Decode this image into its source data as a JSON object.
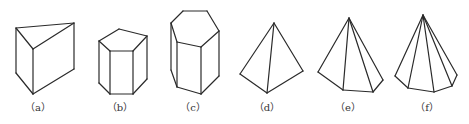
{
  "figure": {
    "title": "",
    "colors": {
      "background": "#ffffff",
      "stroke": "#2a2a2a",
      "label": "#333333"
    },
    "shapes": [
      {
        "id": "a",
        "name": "triangular-prism",
        "label": "（a）",
        "label_pos": [
          38,
          111
        ],
        "edges": [
          [
            [
              16,
              28
            ],
            [
              74,
              23
            ]
          ],
          [
            [
              74,
              23
            ],
            [
              33,
              49
            ]
          ],
          [
            [
              33,
              49
            ],
            [
              16,
              28
            ]
          ],
          [
            [
              16,
              28
            ],
            [
              16,
              73
            ]
          ],
          [
            [
              33,
              49
            ],
            [
              33,
              94
            ]
          ],
          [
            [
              74,
              23
            ],
            [
              74,
              69
            ]
          ],
          [
            [
              16,
              73
            ],
            [
              33,
              94
            ]
          ],
          [
            [
              33,
              94
            ],
            [
              74,
              69
            ]
          ]
        ]
      },
      {
        "id": "b",
        "name": "pentagonal-prism",
        "label": "（b）",
        "label_pos": [
          120,
          111
        ],
        "edges": [
          [
            [
              99,
              41
            ],
            [
              119,
              29
            ]
          ],
          [
            [
              119,
              29
            ],
            [
              147,
              36
            ]
          ],
          [
            [
              147,
              36
            ],
            [
              133,
              51
            ]
          ],
          [
            [
              133,
              51
            ],
            [
              110,
              51
            ]
          ],
          [
            [
              110,
              51
            ],
            [
              99,
              41
            ]
          ],
          [
            [
              99,
              41
            ],
            [
              99,
              83
            ]
          ],
          [
            [
              110,
              51
            ],
            [
              110,
              94
            ]
          ],
          [
            [
              133,
              51
            ],
            [
              133,
              94
            ]
          ],
          [
            [
              147,
              36
            ],
            [
              147,
              79
            ]
          ],
          [
            [
              99,
              83
            ],
            [
              110,
              94
            ]
          ],
          [
            [
              110,
              94
            ],
            [
              133,
              94
            ]
          ],
          [
            [
              133,
              94
            ],
            [
              147,
              79
            ]
          ]
        ]
      },
      {
        "id": "c",
        "name": "hexagonal-prism",
        "label": "（c）",
        "label_pos": [
          193,
          111
        ],
        "edges": [
          [
            [
              171,
              23
            ],
            [
              183,
              11
            ]
          ],
          [
            [
              183,
              11
            ],
            [
              207,
              11
            ]
          ],
          [
            [
              207,
              11
            ],
            [
              219,
              31
            ]
          ],
          [
            [
              219,
              31
            ],
            [
              201,
              47
            ]
          ],
          [
            [
              201,
              47
            ],
            [
              177,
              42
            ]
          ],
          [
            [
              177,
              42
            ],
            [
              171,
              23
            ]
          ],
          [
            [
              171,
              23
            ],
            [
              171,
              70
            ]
          ],
          [
            [
              177,
              42
            ],
            [
              177,
              87
            ]
          ],
          [
            [
              201,
              47
            ],
            [
              201,
              94
            ]
          ],
          [
            [
              219,
              31
            ],
            [
              219,
              76
            ]
          ],
          [
            [
              171,
              70
            ],
            [
              177,
              87
            ]
          ],
          [
            [
              177,
              87
            ],
            [
              201,
              94
            ]
          ],
          [
            [
              201,
              94
            ],
            [
              219,
              76
            ]
          ]
        ]
      },
      {
        "id": "d",
        "name": "triangular-pyramid",
        "label": "（d）",
        "label_pos": [
          267,
          111
        ],
        "edges": [
          [
            [
              274,
              23
            ],
            [
              240,
              74
            ]
          ],
          [
            [
              274,
              23
            ],
            [
              267,
              93
            ]
          ],
          [
            [
              274,
              23
            ],
            [
              303,
              71
            ]
          ],
          [
            [
              240,
              74
            ],
            [
              267,
              93
            ]
          ],
          [
            [
              267,
              93
            ],
            [
              303,
              71
            ]
          ]
        ]
      },
      {
        "id": "e",
        "name": "pentagonal-pyramid",
        "label": "（e）",
        "label_pos": [
          348,
          111
        ],
        "edges": [
          [
            [
              349,
              18
            ],
            [
              318,
              72
            ]
          ],
          [
            [
              349,
              18
            ],
            [
              343,
              90
            ]
          ],
          [
            [
              349,
              18
            ],
            [
              373,
              92
            ]
          ],
          [
            [
              349,
              18
            ],
            [
              383,
              80
            ]
          ],
          [
            [
              318,
              72
            ],
            [
              343,
              90
            ]
          ],
          [
            [
              343,
              90
            ],
            [
              373,
              92
            ]
          ],
          [
            [
              373,
              92
            ],
            [
              383,
              80
            ]
          ]
        ]
      },
      {
        "id": "f",
        "name": "hexagonal-pyramid",
        "label": "（f）",
        "label_pos": [
          427,
          111
        ],
        "edges": [
          [
            [
              423,
              15
            ],
            [
              395,
              76
            ]
          ],
          [
            [
              423,
              15
            ],
            [
              408,
              88
            ]
          ],
          [
            [
              423,
              15
            ],
            [
              434,
              92
            ]
          ],
          [
            [
              423,
              15
            ],
            [
              452,
              86
            ]
          ],
          [
            [
              423,
              15
            ],
            [
              457,
              75
            ]
          ],
          [
            [
              395,
              76
            ],
            [
              408,
              88
            ]
          ],
          [
            [
              408,
              88
            ],
            [
              434,
              92
            ]
          ],
          [
            [
              434,
              92
            ],
            [
              452,
              86
            ]
          ],
          [
            [
              452,
              86
            ],
            [
              457,
              75
            ]
          ]
        ]
      }
    ]
  }
}
